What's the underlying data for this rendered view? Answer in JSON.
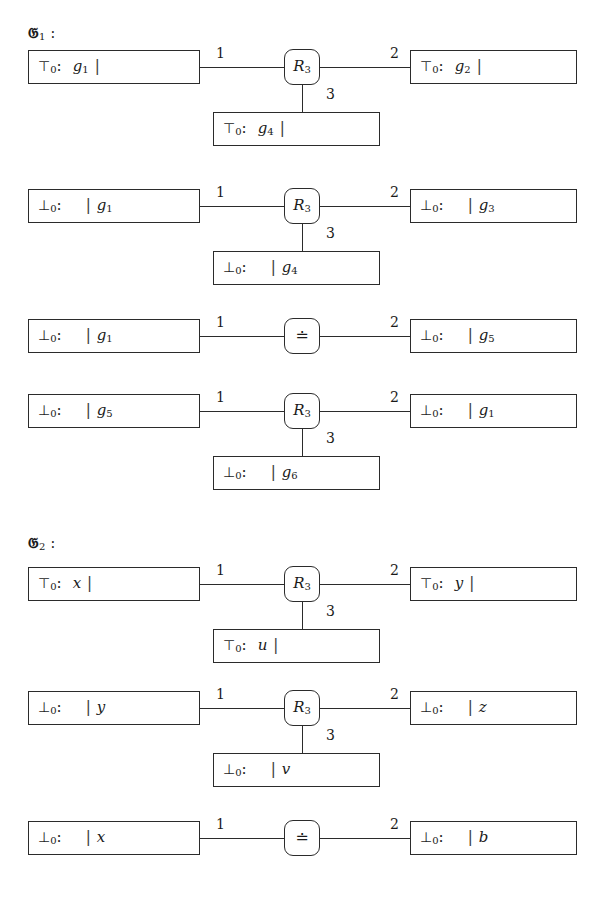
{
  "page": {
    "width": 599,
    "height": 905,
    "background": "#ffffff",
    "ink": "#2b2b2b"
  },
  "symbols": {
    "top": "⊤",
    "bottom": "⊥",
    "colon": ":",
    "bar": "|",
    "subscript_zero": "0",
    "relation_symbol": "R",
    "relation_subscript": "3",
    "equality_symbol": "≐",
    "fraktur_g": "𝔊"
  },
  "groups": [
    {
      "id": "group-1",
      "caption_symbol": "𝔊",
      "caption_subscript": "1",
      "caption_colon": ":",
      "rows": [
        {
          "id": "g1-row-1",
          "node": {
            "kind": "relation",
            "label": "R",
            "subscript": "3"
          },
          "left": {
            "polarity": "⊤",
            "subscript": "0",
            "colon": ":",
            "bar_side": "after",
            "var": "g",
            "var_sub": "1",
            "bar": "|"
          },
          "right": {
            "polarity": "⊤",
            "subscript": "0",
            "colon": ":",
            "bar_side": "after",
            "var": "g",
            "var_sub": "2",
            "bar": "|"
          },
          "bottom": {
            "polarity": "⊤",
            "subscript": "0",
            "colon": ":",
            "bar_side": "after",
            "var": "g",
            "var_sub": "4",
            "bar": "|"
          },
          "edge_labels": {
            "left": "1",
            "right": "2",
            "bottom": "3"
          }
        },
        {
          "id": "g1-row-2",
          "node": {
            "kind": "relation",
            "label": "R",
            "subscript": "3"
          },
          "left": {
            "polarity": "⊥",
            "subscript": "0",
            "colon": ":",
            "bar_side": "before",
            "var": "g",
            "var_sub": "1",
            "bar": "|"
          },
          "right": {
            "polarity": "⊥",
            "subscript": "0",
            "colon": ":",
            "bar_side": "before",
            "var": "g",
            "var_sub": "3",
            "bar": "|"
          },
          "bottom": {
            "polarity": "⊥",
            "subscript": "0",
            "colon": ":",
            "bar_side": "before",
            "var": "g",
            "var_sub": "4",
            "bar": "|"
          },
          "edge_labels": {
            "left": "1",
            "right": "2",
            "bottom": "3"
          }
        },
        {
          "id": "g1-row-3",
          "node": {
            "kind": "equality",
            "label": "≐",
            "subscript": ""
          },
          "left": {
            "polarity": "⊥",
            "subscript": "0",
            "colon": ":",
            "bar_side": "before",
            "var": "g",
            "var_sub": "1",
            "bar": "|"
          },
          "right": {
            "polarity": "⊥",
            "subscript": "0",
            "colon": ":",
            "bar_side": "before",
            "var": "g",
            "var_sub": "5",
            "bar": "|"
          },
          "bottom": null,
          "edge_labels": {
            "left": "1",
            "right": "2",
            "bottom": ""
          }
        },
        {
          "id": "g1-row-4",
          "node": {
            "kind": "relation",
            "label": "R",
            "subscript": "3"
          },
          "left": {
            "polarity": "⊥",
            "subscript": "0",
            "colon": ":",
            "bar_side": "before",
            "var": "g",
            "var_sub": "5",
            "bar": "|"
          },
          "right": {
            "polarity": "⊥",
            "subscript": "0",
            "colon": ":",
            "bar_side": "before",
            "var": "g",
            "var_sub": "1",
            "bar": "|"
          },
          "bottom": {
            "polarity": "⊥",
            "subscript": "0",
            "colon": ":",
            "bar_side": "before",
            "var": "g",
            "var_sub": "6",
            "bar": "|"
          },
          "edge_labels": {
            "left": "1",
            "right": "2",
            "bottom": "3"
          }
        }
      ]
    },
    {
      "id": "group-2",
      "caption_symbol": "𝔊",
      "caption_subscript": "2",
      "caption_colon": ":",
      "rows": [
        {
          "id": "g2-row-1",
          "node": {
            "kind": "relation",
            "label": "R",
            "subscript": "3"
          },
          "left": {
            "polarity": "⊤",
            "subscript": "0",
            "colon": ":",
            "bar_side": "after",
            "var": "x",
            "var_sub": "",
            "bar": "|"
          },
          "right": {
            "polarity": "⊤",
            "subscript": "0",
            "colon": ":",
            "bar_side": "after",
            "var": "y",
            "var_sub": "",
            "bar": "|"
          },
          "bottom": {
            "polarity": "⊤",
            "subscript": "0",
            "colon": ":",
            "bar_side": "after",
            "var": "u",
            "var_sub": "",
            "bar": "|"
          },
          "edge_labels": {
            "left": "1",
            "right": "2",
            "bottom": "3"
          }
        },
        {
          "id": "g2-row-2",
          "node": {
            "kind": "relation",
            "label": "R",
            "subscript": "3"
          },
          "left": {
            "polarity": "⊥",
            "subscript": "0",
            "colon": ":",
            "bar_side": "before",
            "var": "y",
            "var_sub": "",
            "bar": "|"
          },
          "right": {
            "polarity": "⊥",
            "subscript": "0",
            "colon": ":",
            "bar_side": "before",
            "var": "z",
            "var_sub": "",
            "bar": "|"
          },
          "bottom": {
            "polarity": "⊥",
            "subscript": "0",
            "colon": ":",
            "bar_side": "before",
            "var": "v",
            "var_sub": "",
            "bar": "|"
          },
          "edge_labels": {
            "left": "1",
            "right": "2",
            "bottom": "3"
          }
        },
        {
          "id": "g2-row-3",
          "node": {
            "kind": "equality",
            "label": "≐",
            "subscript": ""
          },
          "left": {
            "polarity": "⊥",
            "subscript": "0",
            "colon": ":",
            "bar_side": "before",
            "var": "x",
            "var_sub": "",
            "bar": "|"
          },
          "right": {
            "polarity": "⊥",
            "subscript": "0",
            "colon": ":",
            "bar_side": "before",
            "var": "b",
            "var_sub": "",
            "bar": "|"
          },
          "bottom": null,
          "edge_labels": {
            "left": "1",
            "right": "2",
            "bottom": ""
          }
        }
      ]
    }
  ],
  "geometry": {
    "left_box": {
      "x": 28,
      "w": 172
    },
    "right_box": {
      "x": 410,
      "w": 167
    },
    "bottom_box": {
      "x": 213,
      "w": 167
    },
    "node": {
      "cx": 302,
      "size": 36
    },
    "row_tops": [
      50,
      189,
      319,
      394,
      567,
      691,
      821
    ],
    "caption_tops": [
      26,
      536
    ],
    "row_group_index": [
      0,
      0,
      0,
      0,
      1,
      1,
      1
    ],
    "bottom_offset": 62
  }
}
